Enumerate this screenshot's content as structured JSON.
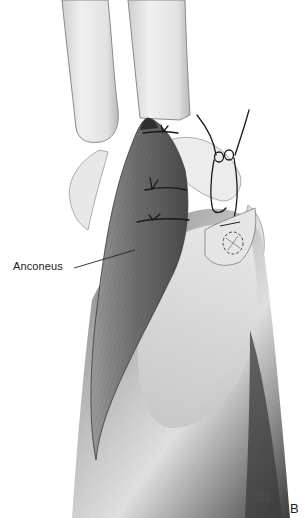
{
  "figure": {
    "panel_letter": "B",
    "labels": {
      "anconeus": "Anconeus"
    },
    "credit": {
      "line1": "MAYO",
      "line2": "©1998"
    },
    "colors": {
      "background": "#ffffff",
      "bone": "#e6e6e6",
      "bone_outline": "#8a8a8a",
      "muscle_dark": "#5a5a5a",
      "muscle_mid": "#8c8c8c",
      "tendon_light": "#d9d9d9",
      "suture": "#1a1a1a",
      "label_text": "#222222"
    }
  }
}
